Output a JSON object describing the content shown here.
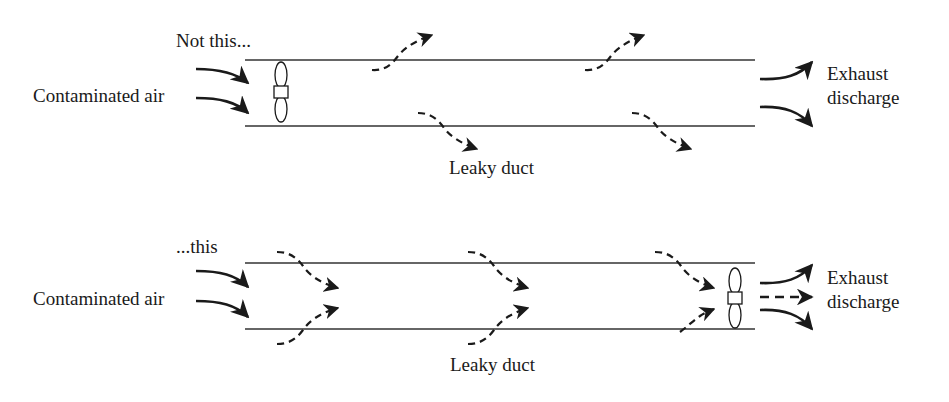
{
  "top_panel": {
    "caption": "Not this...",
    "inlet_label": "Contaminated air",
    "leak_label": "Leaky duct",
    "outlet_label_line1": "Exhaust",
    "outlet_label_line2": "discharge",
    "fan_position": "inlet",
    "leak_direction": "outward"
  },
  "bottom_panel": {
    "caption": "...this",
    "inlet_label": "Contaminated air",
    "leak_label": "Leaky duct",
    "outlet_label_line1": "Exhaust",
    "outlet_label_line2": "discharge",
    "fan_position": "outlet",
    "leak_direction": "inward"
  },
  "colors": {
    "ink": "#1a1a1a",
    "duct": "#333333",
    "background": "#ffffff"
  }
}
